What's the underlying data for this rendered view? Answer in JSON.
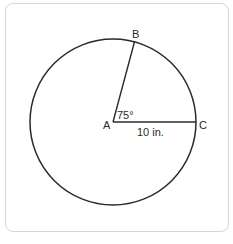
{
  "diagram": {
    "type": "circle-sector",
    "center_label": "A",
    "point_labels": [
      "B",
      "C"
    ],
    "angle_label": "75°",
    "radius_label": "10 in.",
    "angle_degrees": 75,
    "stroke_color": "#2a2a2a",
    "border_color": "#d6d6d6"
  }
}
